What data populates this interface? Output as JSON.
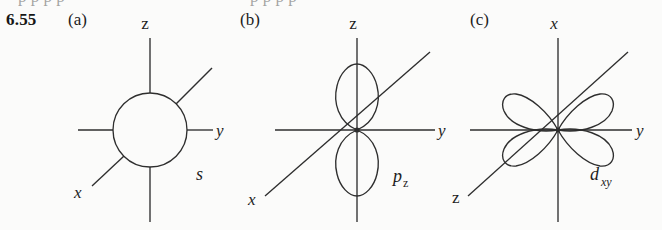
{
  "page": {
    "background_color": "#fbfbfa",
    "ink_color": "#2e2e2e",
    "cutoff_top_text": "p   p        p      p"
  },
  "problem": {
    "number": "6.55"
  },
  "panels": [
    {
      "key": "a",
      "label": "(a)",
      "orbital_label": "s",
      "orbital_subscript": "",
      "orbital_type": "s",
      "lobe_count": 0,
      "axes": [
        {
          "name": "z",
          "label": "z",
          "italic": false,
          "direction": "up"
        },
        {
          "name": "y",
          "label": "y",
          "italic": true,
          "direction": "right"
        },
        {
          "name": "x",
          "label": "x",
          "italic": true,
          "direction": "lower-left-diagonal"
        }
      ]
    },
    {
      "key": "b",
      "label": "(b)",
      "orbital_label": "p",
      "orbital_subscript": "z",
      "orbital_subscript_italic": false,
      "orbital_type": "p",
      "lobe_count": 2,
      "axes": [
        {
          "name": "z",
          "label": "z",
          "italic": false,
          "direction": "up"
        },
        {
          "name": "y",
          "label": "y",
          "italic": true,
          "direction": "right"
        },
        {
          "name": "x",
          "label": "x",
          "italic": true,
          "direction": "lower-left-diagonal"
        }
      ]
    },
    {
      "key": "c",
      "label": "(c)",
      "orbital_label": "d",
      "orbital_subscript": "xy",
      "orbital_subscript_italic": true,
      "orbital_type": "d",
      "lobe_count": 4,
      "axes": [
        {
          "name": "x",
          "label": "x",
          "italic": true,
          "direction": "up"
        },
        {
          "name": "y",
          "label": "y",
          "italic": true,
          "direction": "right"
        },
        {
          "name": "z",
          "label": "z",
          "italic": false,
          "direction": "lower-left-diagonal"
        }
      ]
    }
  ]
}
